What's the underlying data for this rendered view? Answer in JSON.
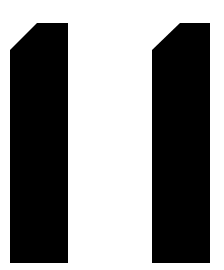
{
  "image": {
    "description": "Two black numeral-one shapes on white background",
    "text": "11",
    "background_color": "#ffffff",
    "glyph_color": "#000000",
    "glyphs": [
      {
        "label": "1",
        "points": "10,50 37,23 68,23 68,263 10,263"
      },
      {
        "label": "1",
        "points": "152,50 180,23 210,23 210,263 152,263"
      }
    ]
  }
}
